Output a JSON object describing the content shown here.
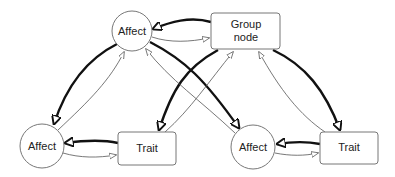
{
  "diagram": {
    "nodes": [
      {
        "id": "affect-top",
        "label": "Affect",
        "shape": "circle"
      },
      {
        "id": "group-node",
        "label_line1": "Group",
        "label_line2": "node",
        "shape": "rounded-rect"
      },
      {
        "id": "affect-bottom-left",
        "label": "Affect",
        "shape": "circle"
      },
      {
        "id": "trait-left",
        "label": "Trait",
        "shape": "rounded-rect"
      },
      {
        "id": "affect-bottom-right",
        "label": "Affect",
        "shape": "circle"
      },
      {
        "id": "trait-right",
        "label": "Trait",
        "shape": "rounded-rect"
      }
    ],
    "edges": [
      {
        "from": "group-node",
        "to": "affect-top",
        "style": "thick"
      },
      {
        "from": "affect-top",
        "to": "group-node",
        "style": "thin"
      },
      {
        "from": "affect-top",
        "to": "affect-bottom-left",
        "style": "thick"
      },
      {
        "from": "affect-bottom-left",
        "to": "affect-top",
        "style": "thin"
      },
      {
        "from": "affect-top",
        "to": "affect-bottom-right",
        "style": "thick"
      },
      {
        "from": "affect-bottom-right",
        "to": "affect-top",
        "style": "thin"
      },
      {
        "from": "group-node",
        "to": "trait-left",
        "style": "thick"
      },
      {
        "from": "trait-left",
        "to": "group-node",
        "style": "thin"
      },
      {
        "from": "group-node",
        "to": "trait-right",
        "style": "thick"
      },
      {
        "from": "trait-right",
        "to": "group-node",
        "style": "thin"
      },
      {
        "from": "trait-left",
        "to": "affect-bottom-left",
        "style": "thick"
      },
      {
        "from": "affect-bottom-left",
        "to": "trait-left",
        "style": "thin"
      },
      {
        "from": "trait-right",
        "to": "affect-bottom-right",
        "style": "thick"
      },
      {
        "from": "affect-bottom-right",
        "to": "trait-right",
        "style": "thin"
      }
    ]
  }
}
